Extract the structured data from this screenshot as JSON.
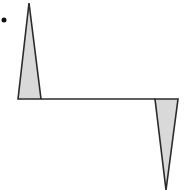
{
  "diagram": {
    "colors": {
      "background": "#ffffff",
      "stroke": "#2b2b2b",
      "fill": "#d9d9d9",
      "dot": "#111111"
    },
    "dot": {
      "cx": 4,
      "cy": 20,
      "r": 2.5
    },
    "baseline": {
      "x1": 41,
      "y1": 99,
      "x2": 155,
      "y2": 99
    },
    "up_spike": {
      "points": "18,99 29,3 41,99"
    },
    "down_spike": {
      "points": "155,99 178,99 166,190"
    }
  }
}
